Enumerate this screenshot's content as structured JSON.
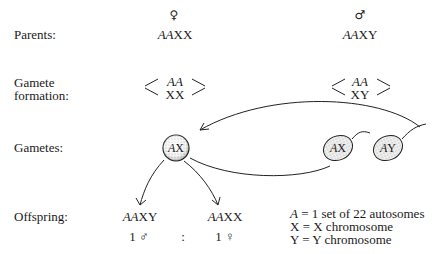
{
  "rows": {
    "parents": "Parents:",
    "gamete_formation_1": "Gamete",
    "gamete_formation_2": "formation:",
    "gametes": "Gametes:",
    "offspring": "Offspring:"
  },
  "female": {
    "symbol": "♀",
    "genotype_italic": "AA",
    "genotype_plain": "XX",
    "gamete_top_italic": "AA",
    "gamete_bottom": "XX",
    "egg_italic": "A",
    "egg_plain": "X"
  },
  "male": {
    "symbol": "♂",
    "genotype_italic": "AA",
    "genotype_plain": "XY",
    "gamete_top_italic": "AA",
    "gamete_bottom": "XY",
    "sperm1_italic": "A",
    "sperm1_plain": "X",
    "sperm2_italic": "A",
    "sperm2_plain": "Y"
  },
  "offspring": {
    "male_italic": "AA",
    "male_plain": "XY",
    "female_italic": "AA",
    "female_plain": "XX",
    "male_ratio": "1 ♂",
    "separator": ":",
    "female_ratio": "1 ♀"
  },
  "legend": [
    {
      "key_italic": "A",
      "key_plain": "",
      "text": " = 1 set of 22 autosomes"
    },
    {
      "key_italic": "",
      "key_plain": "X",
      "text": " = X chromosome"
    },
    {
      "key_italic": "",
      "key_plain": "Y",
      "text": " = Y chromosome"
    }
  ]
}
